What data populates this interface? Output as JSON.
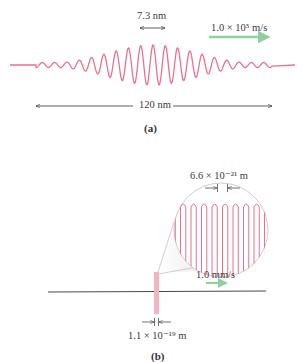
{
  "colors": {
    "wave": "#e8728e",
    "velocity_arrow": "#8fd19e",
    "line": "#333333",
    "magnifier_border": "#c8c8c8"
  },
  "panel_a": {
    "wavelength_label": "7.3 nm",
    "velocity_label": "1.0 × 10⁵ m/s",
    "length_label": "120 nm",
    "caption": "(a)"
  },
  "panel_b": {
    "magnified_wavelength_label": "6.6 × 10⁻²¹ m",
    "velocity_label": "1.0 mm/s",
    "width_label": "1.1 × 10⁻¹⁹ m",
    "caption": "(b)"
  }
}
